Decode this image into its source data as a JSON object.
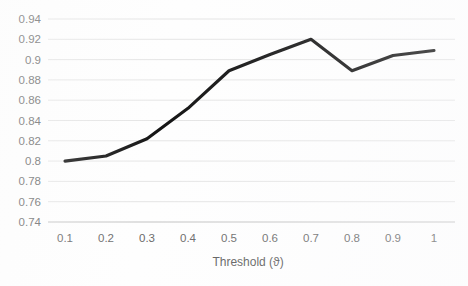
{
  "chart_data": {
    "type": "line",
    "title": "",
    "xlabel": "Threshold (ϑ)",
    "ylabel": "",
    "x": [
      0.1,
      0.2,
      0.3,
      0.4,
      0.5,
      0.6,
      0.7,
      0.8,
      0.9,
      1
    ],
    "values": [
      0.8,
      0.805,
      0.822,
      0.852,
      0.889,
      0.905,
      0.92,
      0.889,
      0.904,
      0.909
    ],
    "series": [
      {
        "name": "",
        "values": [
          0.8,
          0.805,
          0.822,
          0.852,
          0.889,
          0.905,
          0.92,
          0.889,
          0.904,
          0.909
        ]
      }
    ],
    "xlim": [
      0.1,
      1
    ],
    "ylim": [
      0.74,
      0.94
    ],
    "ytick_step": 0.02,
    "xtick_step": 0.1,
    "grid": true,
    "legend": false,
    "legend_position": "none",
    "markers": false,
    "line_color": "#151515",
    "grid_color": "#e2e2e2",
    "axis_color": "#cfcfcf",
    "text_color": "#6a6a6a",
    "background_color": "#fefefe",
    "y_tick_labels": [
      "0.94",
      "0.92",
      "0.9",
      "0.88",
      "0.86",
      "0.84",
      "0.82",
      "0.8",
      "0.78",
      "0.76",
      "0.74"
    ],
    "x_tick_labels": [
      "0.1",
      "0.2",
      "0.3",
      "0.4",
      "0.5",
      "0.6",
      "0.7",
      "0.8",
      "0.9",
      "1"
    ]
  },
  "axis": {
    "x_title": "Threshold (ϑ)"
  }
}
